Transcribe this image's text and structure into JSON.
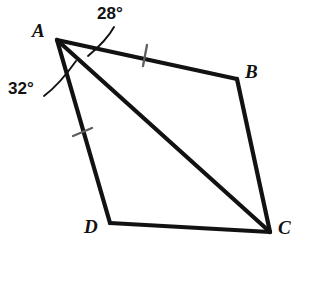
{
  "figure": {
    "background_color": "#ffffff",
    "stroke_color": "#121212",
    "tick_color": "#5a5a5a",
    "vertices": [
      {
        "name": "A",
        "label": "A",
        "x": 57,
        "y": 40
      },
      {
        "name": "B",
        "label": "B",
        "x": 237,
        "y": 79
      },
      {
        "name": "C",
        "label": "C",
        "x": 270,
        "y": 232
      },
      {
        "name": "D",
        "label": "D",
        "x": 110,
        "y": 223
      }
    ],
    "edges": [
      {
        "name": "AB",
        "from": "A",
        "to": "B"
      },
      {
        "name": "BC",
        "from": "B",
        "to": "C"
      },
      {
        "name": "CD",
        "from": "C",
        "to": "D"
      },
      {
        "name": "DA",
        "from": "D",
        "to": "A"
      }
    ],
    "diagonals": [
      {
        "name": "AC",
        "from": "A",
        "to": "C"
      }
    ],
    "tick_marks": [
      {
        "name": "tick-on-AB",
        "segment": "AB",
        "x": 145,
        "y": 55,
        "count": 1
      },
      {
        "name": "tick-on-AD",
        "segment": "AD",
        "x": 82,
        "y": 132,
        "count": 1
      }
    ],
    "angles": [
      {
        "name": "angle-BAC",
        "label": "28°",
        "value": 28,
        "unit": "degrees",
        "at_vertex": "A",
        "between": [
          "AB",
          "AC"
        ]
      },
      {
        "name": "angle-CAD",
        "label": "32°",
        "value": 32,
        "unit": "degrees",
        "at_vertex": "A",
        "between": [
          "AC",
          "AD"
        ]
      }
    ]
  }
}
